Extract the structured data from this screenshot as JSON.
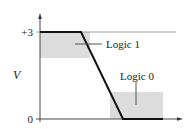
{
  "diagram": {
    "y_axis_label": "V",
    "y_ticks": [
      {
        "label": "+3",
        "value": 3
      },
      {
        "label": "0",
        "value": 0
      }
    ],
    "regions": [
      {
        "label": "Logic 1",
        "fill": "#dcdcdc"
      },
      {
        "label": "Logic 0",
        "fill": "#dcdcdc"
      }
    ],
    "waveform": {
      "description": "falling transition from +3 to 0",
      "color": "#111111"
    }
  }
}
